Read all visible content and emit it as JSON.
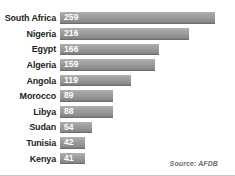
{
  "chart_data": {
    "type": "bar",
    "orientation": "horizontal",
    "title": "",
    "subtitle": "",
    "xlabel": "",
    "ylabel": "",
    "grid": false,
    "legend": null,
    "xlim": [
      0,
      259
    ],
    "categories": [
      "South Africa",
      "Nigeria",
      "Egypt",
      "Algeria",
      "Angola",
      "Morocco",
      "Libya",
      "Sudan",
      "Tunisia",
      "Kenya"
    ],
    "values": [
      259,
      216,
      166,
      159,
      119,
      89,
      88,
      54,
      42,
      41
    ],
    "value_label_color": "#ffffff",
    "bar_color": "#9a9a9a",
    "annotations": [
      "Source: AFDB"
    ]
  },
  "source": {
    "text": "Source: AFDB"
  },
  "colors": {
    "background": "#ffffff",
    "bar_light": "#b3b3b3",
    "bar_dark": "#7e7e7e",
    "label_text": "#231f20",
    "value_text": "#ffffff",
    "source_text": "#6d6d6d",
    "border": "#c8c8c8"
  }
}
